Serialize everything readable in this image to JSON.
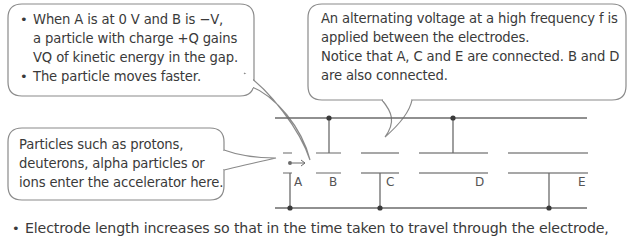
{
  "callouts": {
    "top_left": {
      "bullets": [
        {
          "line1": "When A is at 0 V and B is −V,",
          "line2": "a particle with charge +Q gains",
          "line3": "VQ of kinetic energy in the gap."
        },
        {
          "line1": "The particle moves faster."
        }
      ]
    },
    "top_right": {
      "lines": [
        "An alternating voltage at a high frequency f is",
        "applied between the electrodes.",
        "Notice that A, C and E are connected. B and D",
        "are also connected."
      ]
    },
    "left": {
      "lines": [
        "Particles such as protons,",
        "deuterons, alpha particles or",
        "ions enter the accelerator here."
      ]
    }
  },
  "electrodes": {
    "labels": [
      "A",
      "B",
      "C",
      "D",
      "E"
    ],
    "top_bus_connected": [
      "B",
      "D"
    ],
    "bottom_bus_connected": [
      "A",
      "C",
      "E"
    ]
  },
  "footer": {
    "bullet": "Electrode length increases so that in the time taken to travel through the electrode,"
  },
  "colors": {
    "line": "#6b6b6b",
    "bubble_border": "#8a8a8a",
    "text": "#3a3a3a"
  }
}
